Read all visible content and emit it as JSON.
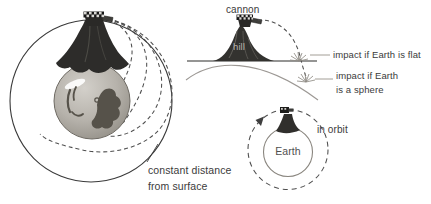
{
  "colors": {
    "background": "#ffffff",
    "outline_dark": "#3a3a3a",
    "dashed_trajectory": "#4e4e4e",
    "flat_ground_line": "#2d2d2b",
    "curved_ground_line": "#9c9894",
    "leader_line": "#a39e96",
    "label_text": "#3b3b3b",
    "hill_fill": "#33322f",
    "hill_label_text": "#b7b4ad",
    "sphere_fill": "#b6b2ab",
    "continent_fill": "#56524a"
  },
  "left_diagram": {
    "note_line1": "constant distance",
    "note_line2": "from surface"
  },
  "flat_vs_sphere_diagram": {
    "cannon_label": "cannon",
    "hill_label": "hill",
    "impact_flat_label": "impact if Earth is flat",
    "impact_sphere_line1": "impact if Earth",
    "impact_sphere_line2": "is a sphere"
  },
  "orbit_diagram": {
    "earth_label": "Earth",
    "orbit_label": "in orbit"
  }
}
